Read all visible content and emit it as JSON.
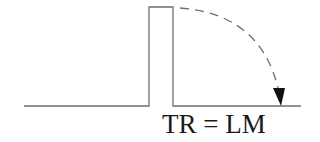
{
  "diagram": {
    "label": "TR = LM",
    "colors": {
      "line": "#6e6e6e",
      "dashed_arc": "#6e6e6e",
      "arrowhead": "#111111",
      "text": "#1a1a1a",
      "background": "#ffffff"
    },
    "elements": [
      {
        "type": "baseline",
        "description": "horizontal line"
      },
      {
        "type": "rectangular-pulse",
        "description": "tall narrow rectangle rising from baseline"
      },
      {
        "type": "dashed-arc-arrow",
        "description": "dashed curved arrow from top of pulse down to baseline on the right"
      }
    ]
  }
}
